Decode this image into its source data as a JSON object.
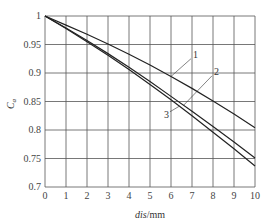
{
  "chart_data": {
    "type": "line",
    "title": "",
    "xlabel": "dis/mm",
    "ylabel": "C_a",
    "xlim": [
      0,
      10
    ],
    "ylim": [
      0.7,
      1.0
    ],
    "grid": true,
    "x_ticks": [
      "0",
      "1",
      "2",
      "3",
      "4",
      "5",
      "6",
      "7",
      "8",
      "9",
      "10"
    ],
    "y_ticks": [
      "0.7",
      "0.75",
      "0.8",
      "0.85",
      "0.9",
      "0.95",
      "1"
    ],
    "x": [
      0,
      1,
      2,
      3,
      4,
      5,
      6,
      7,
      8,
      9,
      10
    ],
    "series": [
      {
        "name": "1",
        "values": [
          1.0,
          0.984,
          0.968,
          0.951,
          0.933,
          0.914,
          0.894,
          0.873,
          0.851,
          0.828,
          0.804
        ]
      },
      {
        "name": "2",
        "values": [
          1.0,
          0.979,
          0.957,
          0.934,
          0.91,
          0.885,
          0.859,
          0.833,
          0.806,
          0.779,
          0.751
        ]
      },
      {
        "name": "3",
        "values": [
          1.0,
          0.978,
          0.955,
          0.931,
          0.906,
          0.88,
          0.853,
          0.825,
          0.796,
          0.767,
          0.737
        ]
      }
    ],
    "annotations": [
      "1",
      "2",
      "3"
    ],
    "legend": "inline labels with leader lines"
  }
}
